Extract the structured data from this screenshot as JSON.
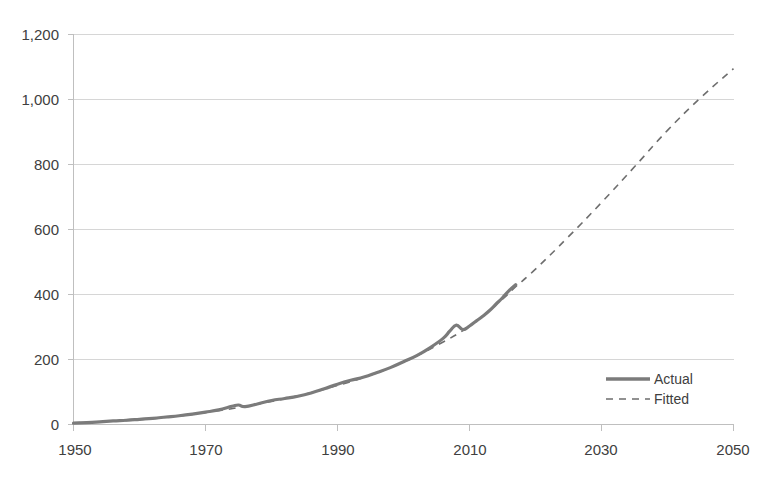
{
  "chart_data": {
    "type": "line",
    "title": "",
    "subtitle": "",
    "xlabel": "",
    "ylabel": "",
    "xlim": [
      1950,
      2050
    ],
    "ylim": [
      0,
      1200
    ],
    "grid": true,
    "grid_axis": "y",
    "legend_position": "inside-lower-right",
    "x_ticks": [
      1950,
      1970,
      1990,
      2010,
      2030,
      2050
    ],
    "x_tick_labels": [
      "1950",
      "1970",
      "1990",
      "2010",
      "2030",
      "2050"
    ],
    "y_ticks": [
      0,
      200,
      400,
      600,
      800,
      1000,
      1200
    ],
    "y_tick_labels": [
      "0",
      "200",
      "400",
      "600",
      "800",
      "1,000",
      "1,200"
    ],
    "series": [
      {
        "name": "Actual",
        "style": "solid",
        "color": "#7b7b7b",
        "x": [
          1950,
          1952,
          1954,
          1956,
          1958,
          1960,
          1962,
          1964,
          1966,
          1968,
          1970,
          1972,
          1974,
          1975,
          1976,
          1978,
          1980,
          1982,
          1984,
          1986,
          1988,
          1990,
          1992,
          1994,
          1996,
          1998,
          2000,
          2002,
          2004,
          2006,
          2007,
          2008,
          2009,
          2010,
          2011,
          2012,
          2013,
          2014,
          2015,
          2016,
          2017
        ],
        "values": [
          4,
          6,
          8,
          11,
          13,
          16,
          19,
          23,
          27,
          32,
          38,
          45,
          56,
          60,
          55,
          64,
          74,
          80,
          87,
          97,
          110,
          124,
          136,
          146,
          160,
          175,
          193,
          212,
          236,
          265,
          287,
          306,
          292,
          303,
          318,
          333,
          350,
          370,
          390,
          412,
          430
        ]
      },
      {
        "name": "Fitted",
        "style": "dashed",
        "color": "#6e6e6e",
        "x": [
          1950,
          1955,
          1960,
          1965,
          1970,
          1975,
          1980,
          1985,
          1990,
          1995,
          2000,
          2005,
          2010,
          2015,
          2017,
          2020,
          2025,
          2030,
          2035,
          2040,
          2045,
          2050
        ],
        "values": [
          5,
          9,
          15,
          24,
          37,
          52,
          71,
          93,
          120,
          152,
          192,
          243,
          303,
          386,
          424,
          478,
          578,
          683,
          793,
          905,
          1005,
          1095
        ]
      }
    ],
    "annotations": []
  },
  "legend": {
    "items": [
      {
        "label": "Actual",
        "style": "solid"
      },
      {
        "label": "Fitted",
        "style": "dashed"
      }
    ]
  },
  "colors": {
    "actual": "#7b7b7b",
    "fitted": "#6e6e6e",
    "grid": "#d6d6d6",
    "axis": "#bfbfbf",
    "text": "#404040",
    "background": "#ffffff"
  }
}
